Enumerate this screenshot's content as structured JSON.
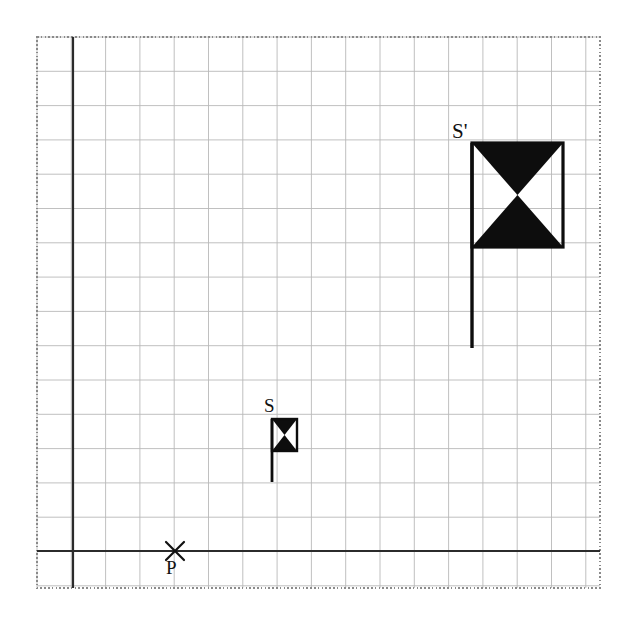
{
  "figure": {
    "background_color": "#ffffff",
    "grid": {
      "visible": true,
      "cell_size_px": 34.3,
      "line_color": "#b9b9b9",
      "line_width": 0.9,
      "area": {
        "x0": 37,
        "y0": 37,
        "x1": 600,
        "y1": 588
      },
      "columns": 17,
      "rows": 16,
      "border": {
        "style": "dotted",
        "color": "#8a8a8a",
        "width": 1.6
      }
    },
    "axes": {
      "color": "#2b2b2b",
      "width": 2.2,
      "x_axis": {
        "label": "",
        "y_px": 551,
        "from_x_px": 37,
        "to_x_px": 600
      },
      "y_axis": {
        "label": "",
        "x_px": 73,
        "from_y_px": 37,
        "to_y_px": 588
      },
      "origin_px": {
        "x": 73,
        "y": 551
      }
    },
    "shapes": [
      {
        "id": "flag-small",
        "label": "S",
        "label_position": "top-left",
        "label_px": {
          "x": 264,
          "y": 412
        },
        "kind": "bowtie-flag",
        "fill_color": "#0d0d0d",
        "outline_color": "#0d0d0d",
        "outline_width": 2.4,
        "rect_px": {
          "x": 272,
          "y": 419,
          "w": 25,
          "h": 32
        },
        "pole_px": {
          "x": 272,
          "y0": 419,
          "y1": 482,
          "width": 2.8
        },
        "grid_units": {
          "width": 0.75,
          "height": 0.95,
          "pole_length": 1.85
        }
      },
      {
        "id": "flag-large",
        "label": "S'",
        "label_position": "top-left",
        "label_px": {
          "x": 452,
          "y": 138
        },
        "kind": "bowtie-flag",
        "fill_color": "#0d0d0d",
        "outline_color": "#0d0d0d",
        "outline_width": 3.2,
        "rect_px": {
          "x": 472,
          "y": 143,
          "w": 91,
          "h": 104
        },
        "pole_px": {
          "x": 472,
          "y0": 143,
          "y1": 348,
          "width": 3.4
        },
        "grid_units": {
          "width": 2.65,
          "height": 3.05,
          "pole_length": 6.0
        }
      }
    ],
    "points": [
      {
        "id": "center-of-dilation",
        "label": "P",
        "marker": "x-cross",
        "marker_color": "#111111",
        "marker_size_px": 18,
        "position_px": {
          "x": 175,
          "y": 551
        },
        "label_px": {
          "x": 166,
          "y": 574
        },
        "on_axis": "x-axis"
      }
    ],
    "labels": {
      "small_flag": "S",
      "large_flag": "S'",
      "center_point": "P"
    }
  }
}
